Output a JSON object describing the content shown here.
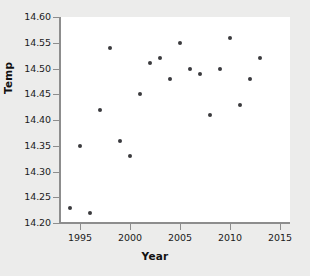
{
  "chart_data": {
    "type": "scatter",
    "title": "",
    "xlabel": "Year",
    "ylabel": "Temp",
    "xlim": [
      1993,
      2016
    ],
    "ylim": [
      14.2,
      14.6
    ],
    "xticks": [
      1995,
      2000,
      2005,
      2010,
      2015
    ],
    "xtick_labels": [
      "1995",
      "2000",
      "2005",
      "2010",
      "2015"
    ],
    "yticks": [
      14.2,
      14.25,
      14.3,
      14.35,
      14.4,
      14.45,
      14.5,
      14.55,
      14.6
    ],
    "ytick_labels": [
      "14.20",
      "14.25",
      "14.30",
      "14.35",
      "14.40",
      "14.45",
      "14.50",
      "14.55",
      "14.60"
    ],
    "grid": false,
    "legend": null,
    "marker_color": "#3a3a3e",
    "points": [
      {
        "x": 1994,
        "y": 14.23
      },
      {
        "x": 1995,
        "y": 14.35
      },
      {
        "x": 1996,
        "y": 14.22
      },
      {
        "x": 1997,
        "y": 14.42
      },
      {
        "x": 1998,
        "y": 14.54
      },
      {
        "x": 1999,
        "y": 14.36
      },
      {
        "x": 2000,
        "y": 14.33
      },
      {
        "x": 2001,
        "y": 14.45
      },
      {
        "x": 2002,
        "y": 14.51
      },
      {
        "x": 2003,
        "y": 14.52
      },
      {
        "x": 2004,
        "y": 14.48
      },
      {
        "x": 2005,
        "y": 14.55
      },
      {
        "x": 2006,
        "y": 14.5
      },
      {
        "x": 2007,
        "y": 14.49
      },
      {
        "x": 2008,
        "y": 14.41
      },
      {
        "x": 2009,
        "y": 14.5
      },
      {
        "x": 2010,
        "y": 14.56
      },
      {
        "x": 2011,
        "y": 14.43
      },
      {
        "x": 2012,
        "y": 14.48
      },
      {
        "x": 2013,
        "y": 14.52
      }
    ]
  },
  "figure": {
    "background_color": "#ececeb",
    "plot_background_color": "#ffffff",
    "axis_color": "#8d8d8d"
  }
}
